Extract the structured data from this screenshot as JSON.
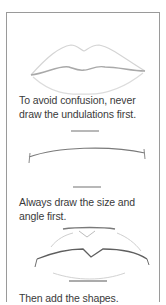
{
  "steps": [
    {
      "caption": "To avoid confusion, never draw the undulations first.",
      "sketch": "lips-complete-icon"
    },
    {
      "caption": "Always draw the size and angle first.",
      "sketch": "lips-guidelines-icon"
    },
    {
      "caption": "Then add the shapes.",
      "sketch": "lips-shapes-icon"
    }
  ]
}
